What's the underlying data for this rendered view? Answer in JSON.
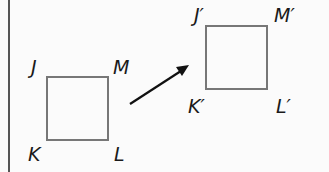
{
  "diagram": {
    "colors": {
      "square": "#777777",
      "arrow": "#111111",
      "label": "#1a1a1a",
      "border": "#555555"
    },
    "original": {
      "labels": {
        "J": "J",
        "M": "M",
        "K": "K",
        "L": "L"
      }
    },
    "image": {
      "labels": {
        "J": "J′",
        "M": "M′",
        "K": "K′",
        "L": "L′"
      }
    },
    "arrow": {
      "from": [
        130,
        104
      ],
      "to": [
        188,
        66
      ],
      "meaning": "translation direction"
    }
  }
}
